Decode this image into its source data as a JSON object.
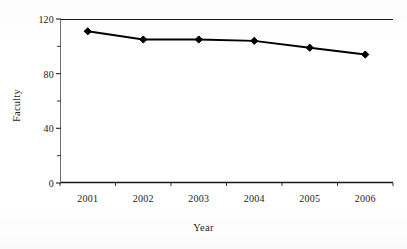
{
  "chart_data": {
    "type": "line",
    "title": "",
    "xlabel": "Year",
    "ylabel": "Faculty",
    "categories": [
      "2001",
      "2002",
      "2003",
      "2004",
      "2005",
      "2006"
    ],
    "values": [
      111,
      105,
      105,
      104,
      99,
      94
    ],
    "series": [
      {
        "name": "Faculty",
        "values": [
          111,
          105,
          105,
          104,
          99,
          94
        ]
      }
    ],
    "ylim": [
      0,
      120
    ],
    "y_ticks": [
      0,
      40,
      80,
      120
    ],
    "y_tick_labels": [
      "0",
      "40",
      "80",
      "120"
    ],
    "y_minor_ticks": [
      20,
      60,
      100
    ],
    "grid": false,
    "legend": "none",
    "marker": "diamond",
    "line_color": "#000000",
    "marker_color": "#000000",
    "axis_color": "#000000",
    "background_color": "#ffffff"
  },
  "axes": {
    "y_title": "Faculty",
    "x_title": "Year"
  }
}
